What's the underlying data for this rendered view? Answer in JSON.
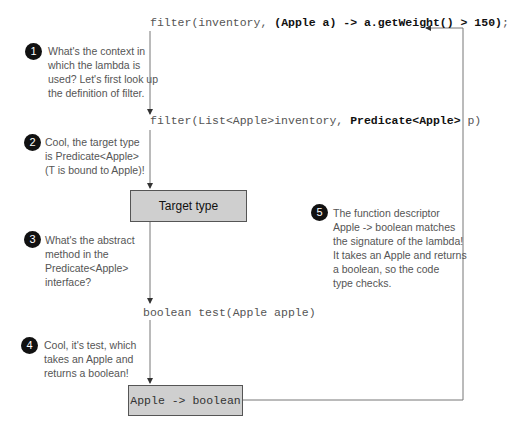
{
  "code_lines": {
    "lambda_prefix": "filter(inventory, ",
    "lambda_bold": "(Apple a) -> a.getWeight() > 150)",
    "lambda_suffix": ";",
    "filter_def_prefix": "filter(List<Apple>inventory, ",
    "filter_def_bold": "Predicate<Apple>",
    "filter_def_suffix": " p)",
    "test_method": "boolean test(Apple apple)"
  },
  "boxes": {
    "target_type": "Target type",
    "descriptor": "Apple -> boolean"
  },
  "notes": [
    {
      "num": "1",
      "lines": [
        "What's the context in",
        "which the lambda is",
        "used? Let's first look up",
        "the definition of filter."
      ]
    },
    {
      "num": "2",
      "lines": [
        "Cool, the target type",
        "is Predicate<Apple>",
        "(T is bound to Apple)!"
      ]
    },
    {
      "num": "3",
      "lines": [
        "What's the abstract",
        "method in the",
        "Predicate<Apple>",
        "interface?"
      ]
    },
    {
      "num": "4",
      "lines": [
        "Cool, it's test, which",
        "takes an Apple and",
        "returns a boolean!"
      ]
    },
    {
      "num": "5",
      "lines": [
        "The function descriptor",
        "Apple -> boolean matches",
        "the signature of the lambda!",
        "It takes an Apple and returns",
        "a boolean, so the code",
        "type checks."
      ]
    }
  ],
  "colors": {
    "box_fill": "#cfcfcf",
    "badge": "#111111",
    "line": "#555555"
  }
}
